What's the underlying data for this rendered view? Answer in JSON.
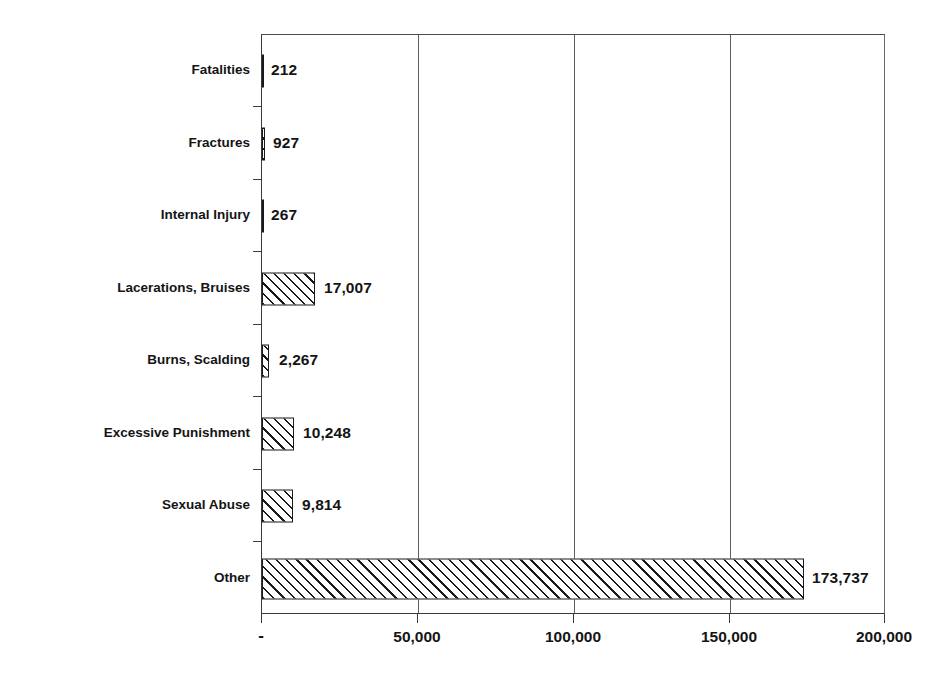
{
  "chart_data": {
    "type": "bar",
    "orientation": "horizontal",
    "title": "",
    "subtitle": "",
    "xlabel": "",
    "ylabel": "",
    "categories": [
      "Fatalities",
      "Fractures",
      "Internal Injury",
      "Lacerations, Bruises",
      "Burns, Scalding",
      "Excessive Punishment",
      "Sexual Abuse",
      "Other"
    ],
    "values": [
      212,
      927,
      267,
      17007,
      2267,
      10248,
      9814,
      173737
    ],
    "value_labels": [
      "212",
      "927",
      "267",
      "17,007",
      "2,267",
      "10,248",
      "9,814",
      "173,737"
    ],
    "xlim": [
      0,
      200000
    ],
    "xticks": [
      0,
      50000,
      100000,
      150000,
      200000
    ],
    "xtick_labels": [
      "-",
      "50,000",
      "100,000",
      "150,000",
      "200,000"
    ],
    "grid": true,
    "grid_axis": "x",
    "legend": false,
    "legend_position": "none",
    "bar_fill": "diagonal-hatch",
    "bar_edge_color": "#1a1a1a",
    "bar_face_color": "#ffffff",
    "axis_color": "#3a3a3a",
    "background_color": "#ffffff"
  },
  "axis": {
    "x_tick_labels": [
      "-",
      "50,000",
      "100,000",
      "150,000",
      "200,000"
    ],
    "y_tick_labels": [
      "Fatalities",
      "Fractures",
      "Internal Injury",
      "Lacerations, Bruises",
      "Burns, Scalding",
      "Excessive Punishment",
      "Sexual Abuse",
      "Other"
    ]
  }
}
